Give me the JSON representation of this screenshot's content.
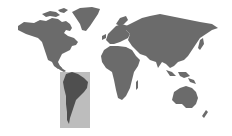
{
  "map": {
    "type": "world-map",
    "projection": "equirectangular-like",
    "background_color": "#ffffff",
    "land_color": "#6b6b6b",
    "highlight": {
      "region": "South America",
      "box_color": "#bdbdbd",
      "land_color": "#4f4f4f",
      "box": {
        "x": 60,
        "y": 72,
        "width": 30,
        "height": 56
      }
    },
    "continents": [
      "North America",
      "Greenland",
      "South America",
      "Europe",
      "Africa",
      "Asia",
      "Oceania"
    ]
  }
}
